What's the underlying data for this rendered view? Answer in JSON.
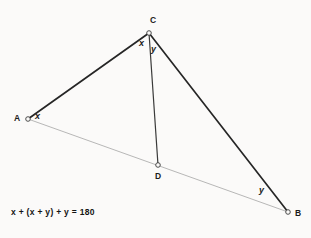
{
  "figure": {
    "background_color": "#fbfaf9",
    "stroke_color": "#262626",
    "light_stroke_color": "#9a9a9a",
    "vertices": [
      {
        "id": "A",
        "label": "A",
        "x": 28,
        "y": 119,
        "label_x": 14,
        "label_y": 114
      },
      {
        "id": "B",
        "label": "B",
        "x": 288,
        "y": 212,
        "label_x": 295,
        "label_y": 209
      },
      {
        "id": "C",
        "label": "C",
        "x": 149,
        "y": 33,
        "label_x": 150,
        "label_y": 16
      },
      {
        "id": "D",
        "label": "D",
        "x": 158,
        "y": 165,
        "label_x": 155,
        "label_y": 172
      }
    ],
    "segments": [
      {
        "name": "segment-AC",
        "from": "A",
        "to": "C",
        "style": "solid",
        "width": 1.6
      },
      {
        "name": "segment-CB",
        "from": "C",
        "to": "B",
        "style": "solid",
        "width": 1.6
      },
      {
        "name": "segment-CD",
        "from": "C",
        "to": "D",
        "style": "solid",
        "width": 1.2
      },
      {
        "name": "segment-AB",
        "from": "A",
        "to": "B",
        "style": "thin",
        "width": 0.7
      }
    ],
    "angle_labels": [
      {
        "name": "angle-label-A",
        "text": "x",
        "x": 35,
        "y": 112
      },
      {
        "name": "angle-label-C-left",
        "text": "x",
        "x": 139,
        "y": 39
      },
      {
        "name": "angle-label-C-right",
        "text": "y",
        "x": 151,
        "y": 45
      },
      {
        "name": "angle-label-B",
        "text": "y",
        "x": 259,
        "y": 186
      }
    ],
    "equation": "x + (x + y) + y = 180"
  }
}
